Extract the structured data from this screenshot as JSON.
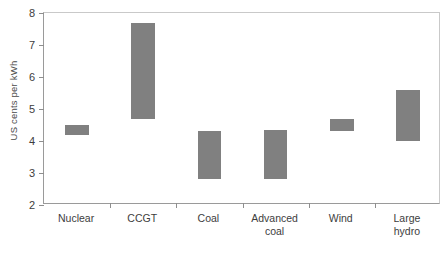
{
  "chart_data": {
    "type": "bar",
    "bar_style": "floating-range",
    "title": "",
    "xlabel": "",
    "ylabel": "US cents per kWh",
    "ylim": [
      2,
      8
    ],
    "y_ticks": [
      2,
      3,
      4,
      5,
      6,
      7,
      8
    ],
    "grid": false,
    "legend": "none",
    "bar_color": "#808080",
    "axis_color": "#8e8e8e",
    "categories": [
      "Nuclear",
      "CCGT",
      "Coal",
      "Advanced coal",
      "Wind",
      "Large hydro"
    ],
    "category_lines": [
      [
        "Nuclear"
      ],
      [
        "CCGT"
      ],
      [
        "Coal"
      ],
      [
        "Advanced",
        "coal"
      ],
      [
        "Wind"
      ],
      [
        "Large",
        "hydro"
      ]
    ],
    "series": [
      {
        "name": "Cost range",
        "low": [
          4.2,
          4.7,
          2.8,
          2.8,
          4.3,
          4.0
        ],
        "high": [
          4.5,
          7.7,
          4.3,
          4.35,
          4.7,
          5.6
        ]
      }
    ],
    "values": [
      {
        "category": "Nuclear",
        "low": 4.2,
        "high": 4.5
      },
      {
        "category": "CCGT",
        "low": 4.7,
        "high": 7.7
      },
      {
        "category": "Coal",
        "low": 2.8,
        "high": 4.3
      },
      {
        "category": "Advanced coal",
        "low": 2.8,
        "high": 4.35
      },
      {
        "category": "Wind",
        "low": 4.3,
        "high": 4.7
      },
      {
        "category": "Large hydro",
        "low": 4.0,
        "high": 5.6
      }
    ]
  }
}
